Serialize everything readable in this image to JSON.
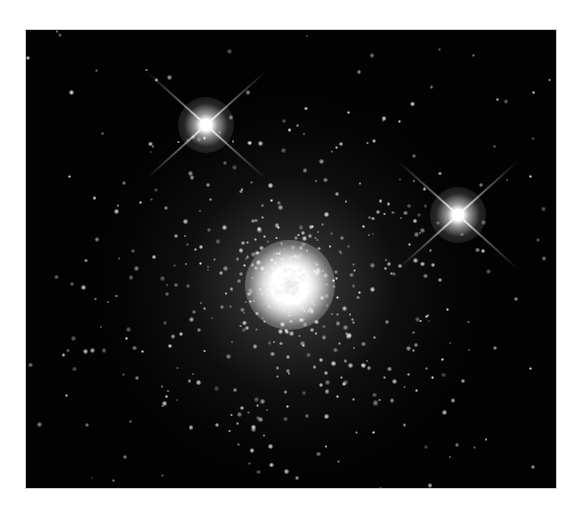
{
  "image": {
    "subject": "globular star cluster",
    "background_color": "#ffffff",
    "frame_color": "#020202",
    "frame": {
      "x": 26,
      "y": 30,
      "width": 530,
      "height": 458
    }
  },
  "features": {
    "cluster_core": {
      "x": 290,
      "y": 285,
      "label": ""
    },
    "bright_stars": [
      {
        "x": 206,
        "y": 125,
        "spikes": true
      },
      {
        "x": 458,
        "y": 215,
        "spikes": true
      }
    ]
  }
}
